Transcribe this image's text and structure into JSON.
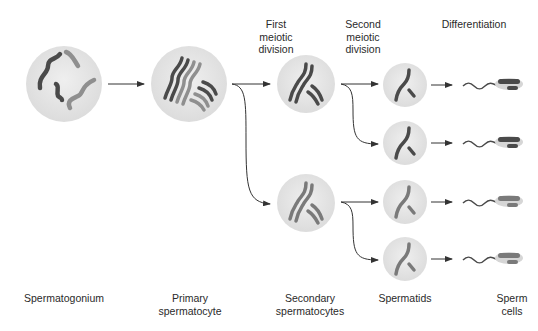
{
  "diagram": {
    "stage_headers": {
      "first_meiotic": "First\nmeiotic\ndivision",
      "second_meiotic": "Second\nmeiotic\ndivision",
      "differentiation": "Differentiation"
    },
    "stage_labels": {
      "spermatogonium": "Spermatogonium",
      "primary": "Primary\nspermatocyte",
      "secondary": "Secondary\nspermatocytes",
      "spermatids": "Spermatids",
      "sperm": "Sperm\ncells"
    },
    "colors": {
      "cell_fill": "#e6e6e6",
      "dark_chromosome": "#4a4a4a",
      "light_chromosome": "#8f8f8f",
      "arrow": "#333333"
    }
  }
}
